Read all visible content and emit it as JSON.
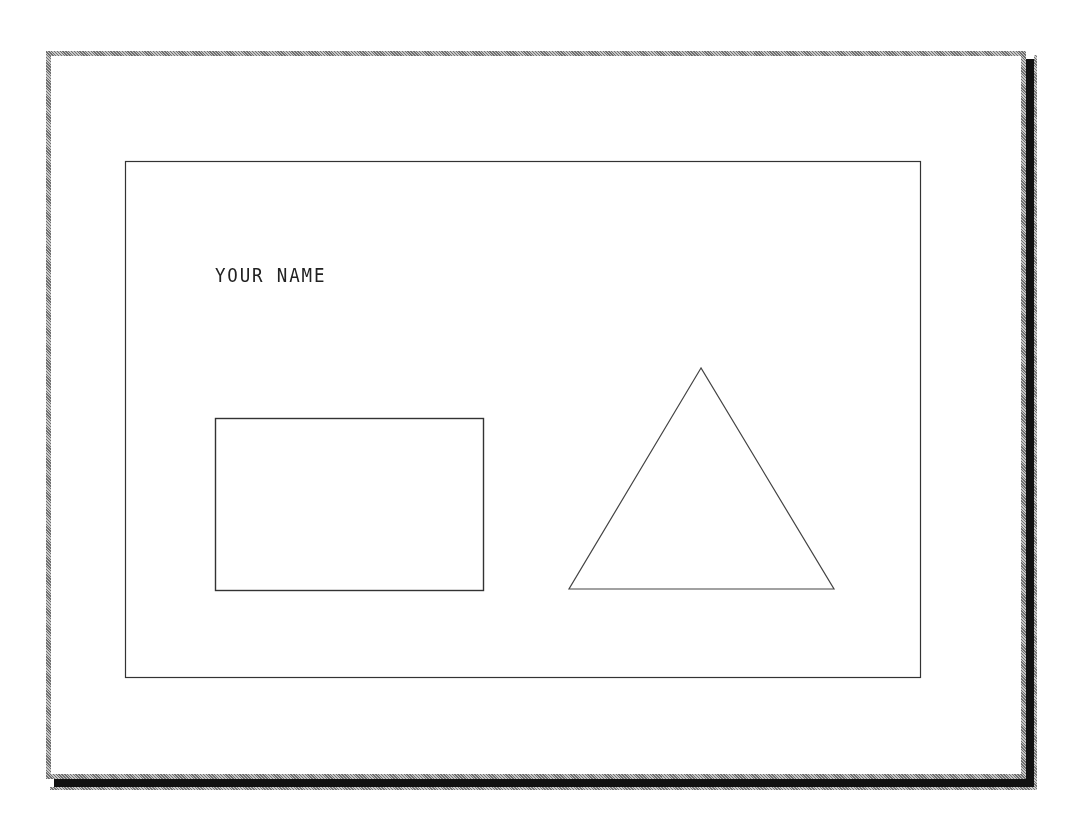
{
  "drawing": {
    "label_text": "YOUR NAME",
    "colors": {
      "background": "#ffffff",
      "line": "#333333",
      "frame_border": "#9a9a9a",
      "shadow": "#111111"
    },
    "border_rect": {
      "x": 125,
      "y": 161,
      "width": 795,
      "height": 516
    },
    "rectangle": {
      "x": 215,
      "y": 418,
      "width": 268,
      "height": 172
    },
    "triangle": {
      "apex": [
        701,
        368
      ],
      "base_left": [
        569,
        589
      ],
      "base_right": [
        834,
        589
      ]
    }
  }
}
